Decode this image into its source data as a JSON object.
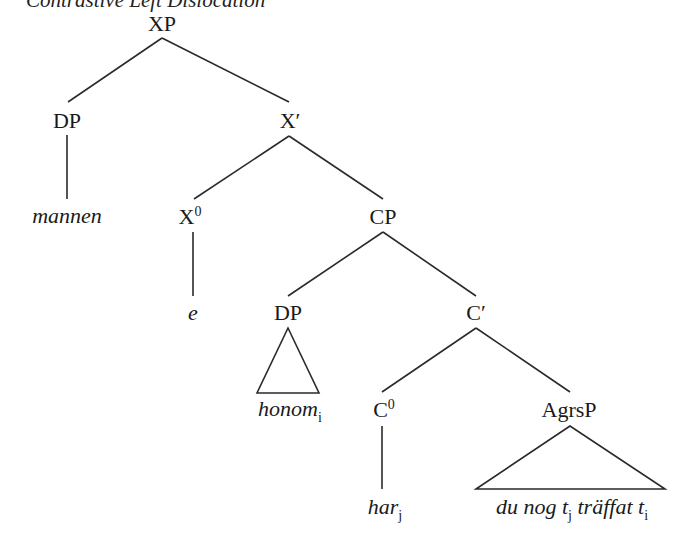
{
  "title": "Contrastive Left Dislocation",
  "colors": {
    "line": "#2a2a2a",
    "text": "#1a1a1a",
    "background": "#ffffff"
  },
  "nodes": {
    "xp": {
      "label": "XP"
    },
    "dp1": {
      "label": "DP"
    },
    "xbar": {
      "label": "X′"
    },
    "mannen": {
      "label": "mannen"
    },
    "x0": {
      "label": "X",
      "sup": "0"
    },
    "cp": {
      "label": "CP"
    },
    "e": {
      "label": "e"
    },
    "dp2": {
      "label": "DP"
    },
    "cbar": {
      "label": "C′"
    },
    "honom": {
      "label": "honom",
      "sub": "i"
    },
    "c0": {
      "label": "C",
      "sup": "0"
    },
    "agrsp": {
      "label": "AgrsP"
    },
    "har": {
      "label": "har",
      "sub": "j"
    },
    "clause": {
      "parts": [
        {
          "text": "du nog t",
          "sub": "j"
        },
        {
          "text": " träffat t",
          "sub": "i"
        }
      ]
    }
  },
  "edges": [
    [
      "XP",
      "DP"
    ],
    [
      "XP",
      "X′"
    ],
    [
      "DP",
      "mannen"
    ],
    [
      "X′",
      "X0"
    ],
    [
      "X′",
      "CP"
    ],
    [
      "X0",
      "e"
    ],
    [
      "CP",
      "DP"
    ],
    [
      "CP",
      "C′"
    ],
    [
      "DP",
      "honom (triangle)"
    ],
    [
      "C′",
      "C0"
    ],
    [
      "C′",
      "AgrsP"
    ],
    [
      "C0",
      "har"
    ],
    [
      "AgrsP",
      "du nog tj träffat ti (triangle)"
    ]
  ]
}
